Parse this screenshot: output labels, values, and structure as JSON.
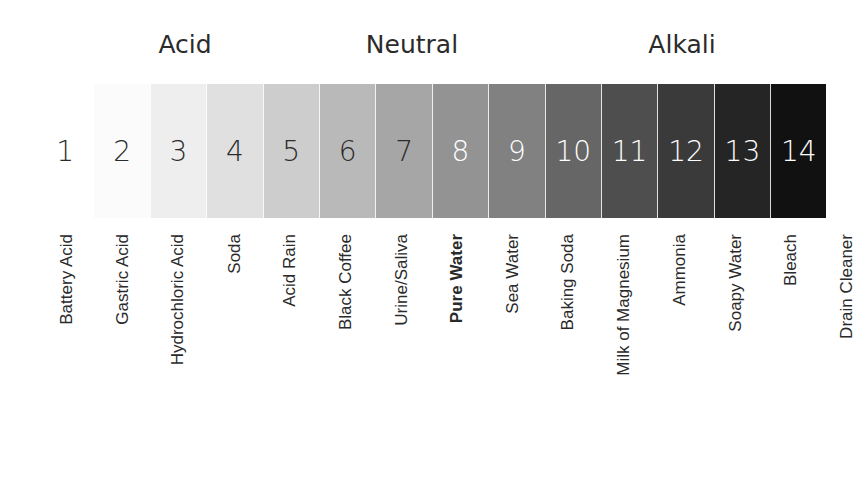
{
  "groups": [
    {
      "label": "Acid",
      "x": 185
    },
    {
      "label": "Neutral",
      "x": 412
    },
    {
      "label": "Alkali",
      "x": 682
    }
  ],
  "scale": [
    {
      "ph": "1",
      "bg": "#ffffff",
      "fg": "#2b2b2b",
      "substance": "Battery Acid",
      "bold": false
    },
    {
      "ph": "2",
      "bg": "#fbfbfb",
      "fg": "#2b2b2b",
      "substance": "Gastric Acid",
      "bold": false
    },
    {
      "ph": "3",
      "bg": "#eeeeee",
      "fg": "#2b2b2b",
      "substance": "Hydrochloric Acid",
      "bold": false
    },
    {
      "ph": "4",
      "bg": "#e0e0e0",
      "fg": "#2b2b2b",
      "substance": "Soda",
      "bold": false
    },
    {
      "ph": "5",
      "bg": "#cdcdcd",
      "fg": "#2b2b2b",
      "substance": "Acid Rain",
      "bold": false
    },
    {
      "ph": "6",
      "bg": "#b9b9b9",
      "fg": "#2b2b2b",
      "substance": "Black Coffee",
      "bold": false
    },
    {
      "ph": "7",
      "bg": "#a6a6a6",
      "fg": "#2b2b2b",
      "substance": "Urine/Saliva",
      "bold": false
    },
    {
      "ph": "8",
      "bg": "#939393",
      "fg": "#ffffff",
      "substance": "Pure Water",
      "bold": true
    },
    {
      "ph": "9",
      "bg": "#818181",
      "fg": "#ffffff",
      "substance": "Sea Water",
      "bold": false
    },
    {
      "ph": "10",
      "bg": "#666666",
      "fg": "#ffffff",
      "substance": "Baking Soda",
      "bold": false
    },
    {
      "ph": "11",
      "bg": "#4e4e4e",
      "fg": "#ffffff",
      "substance": "Milk of Magnesium",
      "bold": false
    },
    {
      "ph": "12",
      "bg": "#3a3a3a",
      "fg": "#ffffff",
      "substance": "Ammonia",
      "bold": false
    },
    {
      "ph": "13",
      "bg": "#252525",
      "fg": "#ffffff",
      "substance": "Soapy Water",
      "bold": false
    },
    {
      "ph": "14",
      "bg": "#111111",
      "fg": "#ffffff",
      "substance": "Bleach",
      "bold": false
    }
  ],
  "extra_label": {
    "substance": "Drain Cleaner"
  }
}
